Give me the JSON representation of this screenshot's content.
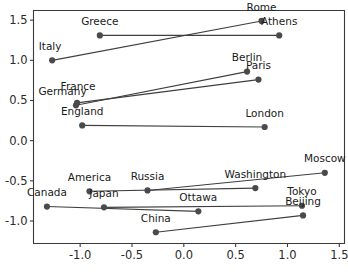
{
  "chart_data": {
    "type": "scatter",
    "title": "",
    "xlabel": "",
    "ylabel": "",
    "xlim": [
      -1.45,
      1.55
    ],
    "ylim": [
      -1.28,
      1.62
    ],
    "grid": false,
    "legend": "none",
    "xticks": [
      -1.0,
      -0.5,
      0.0,
      0.5,
      1.0,
      1.5
    ],
    "xticklabels": [
      "-1.0",
      "-0.5",
      "0.0",
      "0.5",
      "1.0",
      "1.5"
    ],
    "yticks": [
      -1.0,
      -0.5,
      0.0,
      0.5,
      1.0,
      1.5
    ],
    "yticklabels": [
      "-1.0",
      "-0.5",
      "0.0",
      "0.5",
      "1.0",
      "1.5"
    ],
    "marker_color": "#4a4a4a",
    "line_color": "#3f3f3f",
    "points": [
      {
        "label": "Italy",
        "x": -1.27,
        "y": 1.0,
        "label_dx": -0.02,
        "label_dy": 0.13
      },
      {
        "label": "Rome",
        "x": 0.75,
        "y": 1.49,
        "label_dx": 0.0,
        "label_dy": 0.13
      },
      {
        "label": "Greece",
        "x": -0.81,
        "y": 1.31,
        "label_dx": 0.0,
        "label_dy": 0.13
      },
      {
        "label": "Athens",
        "x": 0.92,
        "y": 1.31,
        "label_dx": 0.0,
        "label_dy": 0.13
      },
      {
        "label": "Germany",
        "x": -1.04,
        "y": 0.44,
        "label_dx": -0.13,
        "label_dy": 0.13
      },
      {
        "label": "Berlin",
        "x": 0.61,
        "y": 0.86,
        "label_dx": 0.0,
        "label_dy": 0.13
      },
      {
        "label": "France",
        "x": -1.03,
        "y": 0.47,
        "label_dx": 0.01,
        "label_dy": 0.16
      },
      {
        "label": "Paris",
        "x": 0.72,
        "y": 0.76,
        "label_dx": 0.0,
        "label_dy": 0.13
      },
      {
        "label": "England",
        "x": -0.98,
        "y": 0.19,
        "label_dx": 0.0,
        "label_dy": 0.13
      },
      {
        "label": "London",
        "x": 0.78,
        "y": 0.17,
        "label_dx": 0.0,
        "label_dy": 0.13
      },
      {
        "label": "America",
        "x": -0.91,
        "y": -0.63,
        "label_dx": 0.0,
        "label_dy": 0.13
      },
      {
        "label": "Washington",
        "x": 0.69,
        "y": -0.59,
        "label_dx": 0.0,
        "label_dy": 0.13
      },
      {
        "label": "Russia",
        "x": -0.35,
        "y": -0.62,
        "label_dx": 0.0,
        "label_dy": 0.13
      },
      {
        "label": "Moscow",
        "x": 1.36,
        "y": -0.4,
        "label_dx": 0.0,
        "label_dy": 0.13
      },
      {
        "label": "Canada",
        "x": -1.32,
        "y": -0.82,
        "label_dx": 0.0,
        "label_dy": 0.13
      },
      {
        "label": "Ottawa",
        "x": 0.14,
        "y": -0.88,
        "label_dx": 0.0,
        "label_dy": 0.13
      },
      {
        "label": "Japan",
        "x": -0.77,
        "y": -0.83,
        "label_dx": 0.0,
        "label_dy": 0.13
      },
      {
        "label": "Tokyo",
        "x": 1.14,
        "y": -0.81,
        "label_dx": 0.0,
        "label_dy": 0.13
      },
      {
        "label": "China",
        "x": -0.27,
        "y": -1.14,
        "label_dx": 0.0,
        "label_dy": 0.13
      },
      {
        "label": "Beijing",
        "x": 1.15,
        "y": -0.93,
        "label_dx": 0.0,
        "label_dy": 0.13
      }
    ],
    "pairs": [
      {
        "from": "Italy",
        "to": "Rome"
      },
      {
        "from": "Greece",
        "to": "Athens"
      },
      {
        "from": "Germany",
        "to": "Berlin"
      },
      {
        "from": "France",
        "to": "Paris"
      },
      {
        "from": "England",
        "to": "London"
      },
      {
        "from": "America",
        "to": "Washington"
      },
      {
        "from": "Russia",
        "to": "Moscow"
      },
      {
        "from": "Canada",
        "to": "Ottawa"
      },
      {
        "from": "Japan",
        "to": "Tokyo"
      },
      {
        "from": "China",
        "to": "Beijing"
      }
    ]
  }
}
